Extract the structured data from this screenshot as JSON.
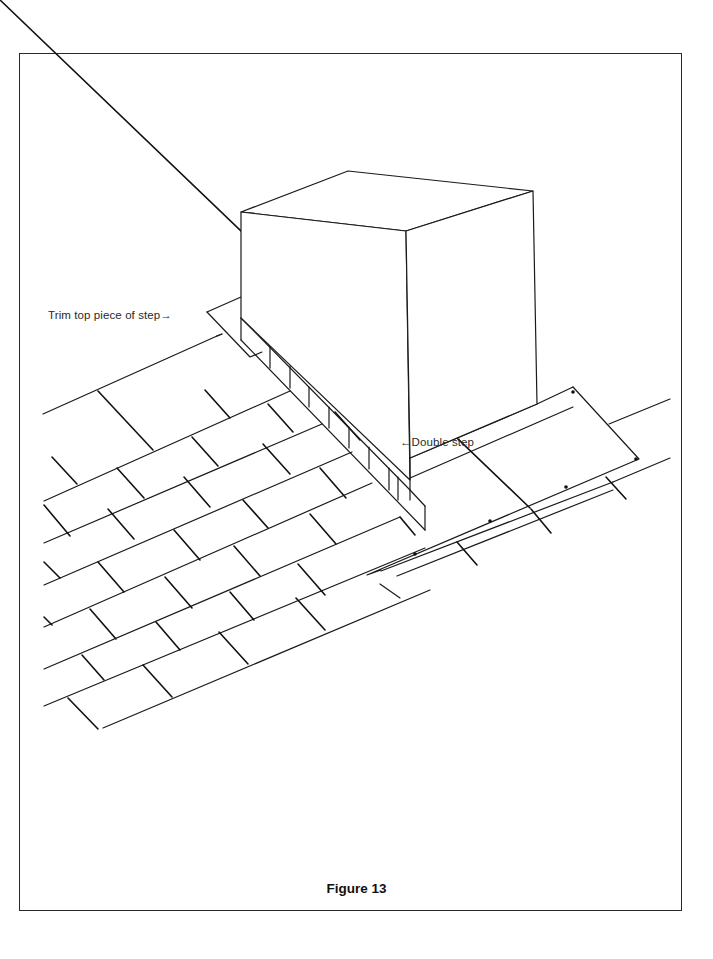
{
  "figure": {
    "caption": "Figure 13",
    "labels": {
      "trim_top": "Trim top piece of step→",
      "double_step": "←Double step"
    }
  },
  "colors": {
    "line": "#1a1a1a",
    "background": "#ffffff",
    "frame": "#2a2a2a"
  }
}
